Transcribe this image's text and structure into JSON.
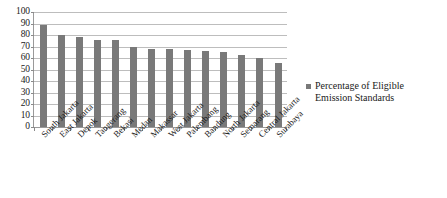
{
  "chart_data": {
    "type": "bar",
    "title": "",
    "subtitle": "",
    "xlabel": "",
    "ylabel": "",
    "ylim": [
      0,
      100
    ],
    "y_ticks": [
      100,
      90,
      80,
      70,
      60,
      50,
      40,
      30,
      20,
      10,
      0
    ],
    "grid": true,
    "orientation": "vertical",
    "legend_position": "right",
    "bar_color": "#797979",
    "categories": [
      "South Jakarta",
      "East Jakarta",
      "Depok",
      "Tangerang",
      "Bekasi",
      "Medan",
      "Makassar",
      "West Jakarta",
      "Palembang",
      "Bandung",
      "North Jakarta",
      "Semarang",
      "Central Jakarta",
      "Surabaya"
    ],
    "series": [
      {
        "name": "Percentage of Eligible Emission Standards",
        "values": [
          89,
          80,
          78,
          76,
          76,
          70,
          68,
          68,
          67,
          66,
          65,
          63,
          60,
          56
        ]
      }
    ]
  },
  "legend": {
    "entries": [
      {
        "label_line1": "Percentage of Eligible",
        "label_line2": "Emission Standards",
        "color": "#797979"
      }
    ]
  },
  "colors": {
    "bar": "#797979",
    "gridline": "#bdbdbd",
    "axis": "#9a9a9a",
    "text": "#1a1a1a",
    "background": "#ffffff"
  }
}
